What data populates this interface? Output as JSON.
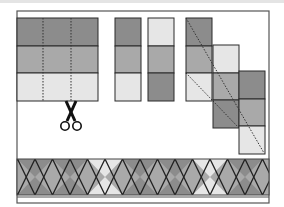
{
  "figure": {
    "colors": {
      "dark": "#8c8c8c",
      "medium": "#a9a9a9",
      "light": "#e6e6e6",
      "outline": "#2a2a2a",
      "frame": "#555555",
      "background": "#ffffff"
    },
    "sewn_block": {
      "rows": [
        "dark",
        "medium",
        "light"
      ],
      "cut_lines": 2
    },
    "cut_strips": [
      {
        "rows": [
          "dark",
          "medium",
          "light"
        ]
      },
      {
        "rows": [
          "light",
          "medium",
          "dark"
        ]
      }
    ],
    "staircase_columns": [
      {
        "rows": [
          "dark",
          "medium",
          "light"
        ]
      },
      {
        "rows": [
          "light",
          "medium",
          "dark"
        ]
      },
      {
        "rows": [
          "dark",
          "medium",
          "light"
        ]
      }
    ],
    "border": {
      "diamond_fill": "medium",
      "top_triangles": [
        "dark",
        "dark",
        "light",
        "dark",
        "dark",
        "light",
        "dark"
      ],
      "bottom_triangles": [
        "dark",
        "dark",
        "light",
        "dark",
        "dark",
        "light",
        "dark"
      ]
    },
    "icons": {
      "scissors": "scissors-icon"
    }
  }
}
